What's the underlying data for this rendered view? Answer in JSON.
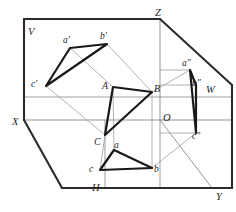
{
  "figure": {
    "background_color": "#ffffff",
    "line_color_heavy": "#2b2b2b",
    "line_color_light": "#8f8f8f",
    "triangle_color": "#191919"
  },
  "planes": [
    {
      "id": "V",
      "label": "V",
      "name": "vertical-frontal-plane",
      "x": 28,
      "y": 27
    },
    {
      "id": "H",
      "label": "H",
      "name": "horizontal-plane",
      "x": 92,
      "y": 183
    },
    {
      "id": "W",
      "label": "W",
      "name": "profile-side-plane",
      "x": 206,
      "y": 85
    }
  ],
  "axes": [
    {
      "id": "X",
      "label": "X",
      "name": "x-axis",
      "x": 12,
      "y": 117
    },
    {
      "id": "Y",
      "label": "Y",
      "name": "y-axis",
      "x": 216,
      "y": 192
    },
    {
      "id": "Z",
      "label": "Z",
      "name": "z-axis",
      "x": 155,
      "y": 8
    },
    {
      "id": "O",
      "label": "O",
      "name": "origin",
      "x": 163,
      "y": 113
    }
  ],
  "space_triangle": {
    "name": "space-triangle-ABC",
    "points": "113,87 152,92 105,135",
    "vertices": [
      {
        "id": "A",
        "label": "A",
        "x": 113,
        "y": 87,
        "lx": 102,
        "ly": 81
      },
      {
        "id": "B",
        "label": "B",
        "x": 152,
        "y": 92,
        "lx": 154,
        "ly": 84
      },
      {
        "id": "C",
        "label": "C",
        "x": 105,
        "y": 135,
        "lx": 94,
        "ly": 137
      }
    ]
  },
  "frontal_projection": {
    "name": "frontal-projection-triangle",
    "points": "70,48 107,44 46,86",
    "vertices": [
      {
        "id": "a'",
        "label": "a′",
        "x": 70,
        "y": 48,
        "lx": 63,
        "ly": 36
      },
      {
        "id": "b'",
        "label": "b′",
        "x": 107,
        "y": 44,
        "lx": 100,
        "ly": 32
      },
      {
        "id": "c'",
        "label": "c′",
        "x": 46,
        "y": 86,
        "lx": 31,
        "ly": 80
      }
    ]
  },
  "horizontal_projection": {
    "name": "horizontal-projection-triangle",
    "points": "114,150 152,168 100,170",
    "vertices": [
      {
        "id": "a",
        "label": "a",
        "x": 114,
        "y": 150,
        "lx": 114,
        "ly": 141
      },
      {
        "id": "b",
        "label": "b",
        "x": 152,
        "y": 168,
        "lx": 154,
        "ly": 165
      },
      {
        "id": "c",
        "label": "c",
        "x": 100,
        "y": 170,
        "lx": 89,
        "ly": 165
      }
    ]
  },
  "profile_projection": {
    "name": "profile-projection-triangle",
    "points": "190,70 196,85 196,133",
    "vertices": [
      {
        "id": "a''",
        "label": "a″",
        "x": 190,
        "y": 70,
        "lx": 182,
        "ly": 59
      },
      {
        "id": "b''",
        "label": "b″",
        "x": 196,
        "y": 85,
        "lx": 192,
        "ly": 79
      },
      {
        "id": "c''",
        "label": "c″",
        "x": 196,
        "y": 133,
        "lx": 192,
        "ly": 132
      }
    ]
  },
  "plane_outlines": {
    "v_plane_heavy": "M 24,19 L 24,120",
    "v_plane_top": "M 24,19 L 160,19",
    "z_to_y_edge": "M 160,19 L 232,85",
    "w_right_edge": "M 232,85 L 232,188",
    "h_bottom_edge": "M 62,188 L 232,188",
    "x_to_h": "M 24,120 L 62,188",
    "o_to_y_diagonal": "M 160,120 L 212,188",
    "x_to_o_axis": "M 24,120 L 160,120",
    "o_to_z_axis": "M 160,120 L 160,19",
    "o_to_w_edge": "M 160,120 L 232,120",
    "h_inner_left": "M 105,120 L 105,188",
    "h_inner_right": "M 160,120 L 160,188",
    "v_inner_bottom": "M 24,97 L 160,97",
    "w_inner_line": "M 160,97 L 232,97"
  },
  "projector_lines": [
    {
      "name": "projector-b-prime-to-B",
      "d": "M 107,44 L 152,92"
    },
    {
      "name": "projector-B-to-a-double-prime",
      "d": "M 152,92 L 190,70"
    },
    {
      "name": "projector-c-prime-to-C",
      "d": "M 46,86 L 105,135"
    },
    {
      "name": "projector-a-prime-to-A",
      "d": "M 70,48 L 113,87"
    },
    {
      "name": "projector-A-to-a",
      "d": "M 113,87 L 114,150"
    },
    {
      "name": "projector-B-to-b",
      "d": "M 152,92 L 152,168"
    },
    {
      "name": "projector-C-to-c",
      "d": "M 105,135 L 100,170"
    },
    {
      "name": "projector-b-to-b-double-prime",
      "d": "M 152,168 L 196,133"
    },
    {
      "name": "projector-a-double-prime-horizontal",
      "d": "M 160,70 L 190,70"
    },
    {
      "name": "projector-b-double-prime-horizontal",
      "d": "M 160,85 L 196,85"
    },
    {
      "name": "projector-c-double-prime-horizontal",
      "d": "M 160,133 L 196,133"
    }
  ]
}
